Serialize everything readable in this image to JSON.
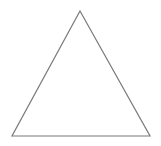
{
  "diagram": {
    "shape": "triangle",
    "kind": "equilateral-outline",
    "background": "#ffffff",
    "stroke_color": "#7a7a7a",
    "stroke_width": 1.2,
    "fill": "none",
    "vertices": {
      "apex": [
        80,
        11
      ],
      "bottom_left": [
        12,
        136
      ],
      "bottom_right": [
        150,
        136
      ]
    }
  }
}
